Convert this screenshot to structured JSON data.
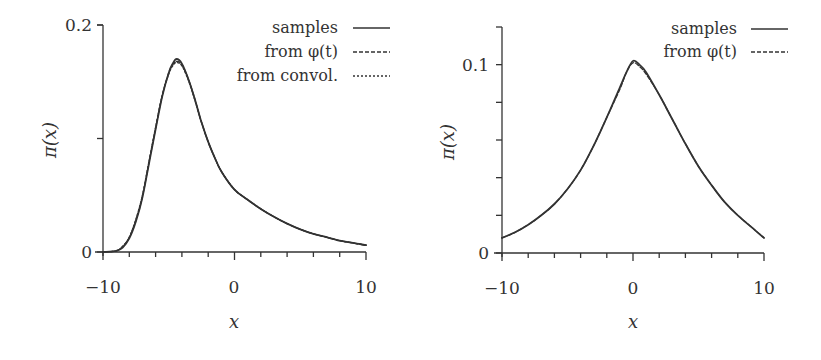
{
  "chart_data": [
    {
      "type": "line",
      "panel": "left",
      "title": "",
      "xlabel": "x",
      "ylabel": "π(x)",
      "xlim": [
        -10,
        10
      ],
      "ylim": [
        0,
        0.2
      ],
      "xticks": [
        -10,
        0,
        10
      ],
      "xtick_labels": [
        "−10",
        "0",
        "10"
      ],
      "x_minor_step": 2,
      "yticks": [
        0,
        0.1,
        0.2
      ],
      "ytick_labels": [
        "0",
        "",
        "0.2"
      ],
      "grid": false,
      "legend_position": "upper right",
      "x": [
        -10,
        -9,
        -8.5,
        -8,
        -7.5,
        -7,
        -6.5,
        -6,
        -5.5,
        -5,
        -4.7,
        -4.4,
        -4,
        -3.5,
        -3,
        -2.5,
        -2,
        -1.5,
        -1,
        0,
        1,
        2,
        3,
        4,
        5,
        6,
        7,
        8,
        9,
        10
      ],
      "series": [
        {
          "name": "samples",
          "style": "solid",
          "values": [
            0,
            0.001,
            0.004,
            0.012,
            0.027,
            0.048,
            0.078,
            0.108,
            0.137,
            0.158,
            0.166,
            0.17,
            0.166,
            0.152,
            0.134,
            0.114,
            0.097,
            0.083,
            0.071,
            0.055,
            0.046,
            0.038,
            0.031,
            0.025,
            0.02,
            0.016,
            0.013,
            0.01,
            0.008,
            0.006
          ]
        },
        {
          "name": "from φ(t)",
          "style": "dashed",
          "values": [
            0,
            0.001,
            0.005,
            0.013,
            0.028,
            0.049,
            0.079,
            0.109,
            0.138,
            0.158,
            0.165,
            0.168,
            0.165,
            0.152,
            0.134,
            0.114,
            0.097,
            0.083,
            0.071,
            0.055,
            0.046,
            0.038,
            0.031,
            0.025,
            0.02,
            0.016,
            0.013,
            0.01,
            0.008,
            0.006
          ]
        },
        {
          "name": "from convol.",
          "style": "dotted",
          "values": [
            0,
            0.001,
            0.005,
            0.013,
            0.029,
            0.05,
            0.08,
            0.11,
            0.138,
            0.157,
            0.164,
            0.167,
            0.164,
            0.151,
            0.133,
            0.114,
            0.097,
            0.083,
            0.071,
            0.055,
            0.046,
            0.038,
            0.031,
            0.025,
            0.02,
            0.016,
            0.013,
            0.01,
            0.008,
            0.006
          ]
        }
      ],
      "legend": [
        "samples",
        "from φ(t)",
        "from convol."
      ]
    },
    {
      "type": "line",
      "panel": "right",
      "title": "",
      "xlabel": "x",
      "ylabel": "π(x)",
      "xlim": [
        -10,
        10
      ],
      "ylim": [
        0,
        0.12
      ],
      "xticks": [
        -10,
        0,
        10
      ],
      "xtick_labels": [
        "−10",
        "0",
        "10"
      ],
      "x_minor_step": 2,
      "yticks": [
        0,
        0.02,
        0.04,
        0.06,
        0.08,
        0.1
      ],
      "ytick_labels": [
        "0",
        "",
        "",
        "",
        "",
        "0.1"
      ],
      "grid": false,
      "legend_position": "upper right",
      "x": [
        -10,
        -9,
        -8,
        -7,
        -6,
        -5,
        -4,
        -3,
        -2,
        -1,
        -0.5,
        0,
        0.5,
        1,
        2,
        3,
        4,
        5,
        6,
        7,
        8,
        9,
        10
      ],
      "series": [
        {
          "name": "samples",
          "style": "solid",
          "values": [
            0.008,
            0.011,
            0.015,
            0.02,
            0.026,
            0.034,
            0.044,
            0.057,
            0.072,
            0.088,
            0.096,
            0.102,
            0.1,
            0.096,
            0.084,
            0.071,
            0.058,
            0.046,
            0.036,
            0.027,
            0.02,
            0.014,
            0.008
          ]
        },
        {
          "name": "from φ(t)",
          "style": "dashed",
          "values": [
            0.008,
            0.011,
            0.015,
            0.02,
            0.026,
            0.034,
            0.044,
            0.057,
            0.072,
            0.087,
            0.096,
            0.101,
            0.099,
            0.095,
            0.084,
            0.071,
            0.058,
            0.046,
            0.036,
            0.027,
            0.02,
            0.014,
            0.008
          ]
        }
      ],
      "legend": [
        "samples",
        "from φ(t)"
      ]
    }
  ],
  "panels": {
    "left": {
      "ylabel": "π(x)",
      "xlabel": "x",
      "ytick_top": "0.2",
      "ytick_zero": "0",
      "xtick_left": "−10",
      "xtick_mid": "0",
      "xtick_right": "10",
      "legend": [
        "samples",
        "from φ(t)",
        "from convol."
      ]
    },
    "right": {
      "ylabel": "π(x)",
      "xlabel": "x",
      "ytick_top": "0.1",
      "ytick_zero": "0",
      "xtick_left": "−10",
      "xtick_mid": "0",
      "xtick_right": "10",
      "legend": [
        "samples",
        "from φ(t)"
      ]
    }
  },
  "colors": {
    "ink": "#333333",
    "background": "#ffffff"
  }
}
